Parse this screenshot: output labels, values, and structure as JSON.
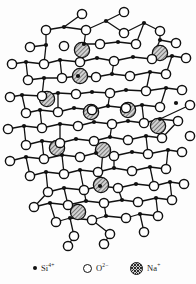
{
  "figure": {
    "background_color": "#fdfdfd",
    "width": 196,
    "height": 284
  },
  "style": {
    "bond_color": "#111111",
    "bond_width": 1.3,
    "silicon_color": "#111111",
    "silicon_radius": 2.1,
    "oxygen_fill": "#ffffff",
    "oxygen_stroke": "#111111",
    "oxygen_radius": 4.6,
    "sodium_fill": "#cfcfcf",
    "sodium_stroke": "#111111",
    "sodium_radius": 7.6
  },
  "legend": {
    "entries": [
      {
        "id": "silicon",
        "symbol": "silicon-dot-swatch",
        "element": "Si",
        "charge": "4+",
        "label": "Si4+"
      },
      {
        "id": "oxygen",
        "symbol": "oxygen-circle-swatch",
        "element": "O",
        "charge": "2-",
        "label": "O2-"
      },
      {
        "id": "sodium",
        "symbol": "sodium-hatched-swatch",
        "element": "Na",
        "charge": "+",
        "label": "Na+"
      }
    ]
  },
  "chart_data": {
    "type": "scatter",
    "xlabel": "",
    "ylabel": "",
    "xlim": [
      0,
      196
    ],
    "ylim": [
      0,
      250
    ],
    "grid": false,
    "legend_position": "bottom",
    "series": [
      {
        "name": "Si4+",
        "marker": "filled-circle",
        "points": [
          [
            64,
            27
          ],
          [
            106,
            21
          ],
          [
            144,
            23
          ],
          [
            46,
            45
          ],
          [
            84,
            44
          ],
          [
            118,
            42
          ],
          [
            160,
            40
          ],
          [
            26,
            62
          ],
          [
            60,
            60
          ],
          [
            97,
            58
          ],
          [
            133,
            57
          ],
          [
            172,
            56
          ],
          [
            44,
            78
          ],
          [
            78,
            76
          ],
          [
            112,
            74
          ],
          [
            150,
            72
          ],
          [
            22,
            95
          ],
          [
            58,
            93
          ],
          [
            92,
            92
          ],
          [
            126,
            90
          ],
          [
            166,
            88
          ],
          [
            40,
            110
          ],
          [
            74,
            108
          ],
          [
            108,
            106
          ],
          [
            142,
            105
          ],
          [
            176,
            103
          ],
          [
            24,
            126
          ],
          [
            60,
            124
          ],
          [
            94,
            122
          ],
          [
            128,
            121
          ],
          [
            160,
            119
          ],
          [
            42,
            141
          ],
          [
            76,
            139
          ],
          [
            110,
            137
          ],
          [
            146,
            136
          ],
          [
            26,
            157
          ],
          [
            62,
            155
          ],
          [
            96,
            153
          ],
          [
            132,
            152
          ],
          [
            168,
            150
          ],
          [
            46,
            172
          ],
          [
            80,
            170
          ],
          [
            114,
            168
          ],
          [
            150,
            167
          ],
          [
            64,
            188
          ],
          [
            100,
            186
          ],
          [
            136,
            184
          ],
          [
            170,
            182
          ],
          [
            50,
            203
          ],
          [
            86,
            201
          ],
          [
            122,
            200
          ],
          [
            156,
            198
          ],
          [
            70,
            218
          ],
          [
            106,
            216
          ],
          [
            140,
            214
          ]
        ]
      },
      {
        "name": "O2-",
        "marker": "open-circle",
        "points": [
          [
            82,
            14
          ],
          [
            124,
            12
          ],
          [
            46,
            30
          ],
          [
            86,
            30
          ],
          [
            124,
            33
          ],
          [
            160,
            31
          ],
          [
            30,
            47
          ],
          [
            64,
            46
          ],
          [
            100,
            44
          ],
          [
            136,
            44
          ],
          [
            176,
            43
          ],
          [
            12,
            64
          ],
          [
            44,
            64
          ],
          [
            80,
            62
          ],
          [
            114,
            61
          ],
          [
            152,
            59
          ],
          [
            186,
            58
          ],
          [
            28,
            80
          ],
          [
            62,
            78
          ],
          [
            96,
            77
          ],
          [
            130,
            76
          ],
          [
            166,
            74
          ],
          [
            10,
            97
          ],
          [
            42,
            96
          ],
          [
            76,
            94
          ],
          [
            110,
            93
          ],
          [
            146,
            91
          ],
          [
            182,
            90
          ],
          [
            26,
            113
          ],
          [
            58,
            112
          ],
          [
            92,
            110
          ],
          [
            126,
            108
          ],
          [
            160,
            107
          ],
          [
            190,
            105
          ],
          [
            8,
            129
          ],
          [
            42,
            128
          ],
          [
            78,
            126
          ],
          [
            112,
            124
          ],
          [
            144,
            123
          ],
          [
            178,
            121
          ],
          [
            26,
            145
          ],
          [
            60,
            143
          ],
          [
            94,
            141
          ],
          [
            128,
            140
          ],
          [
            162,
            138
          ],
          [
            190,
            136
          ],
          [
            10,
            161
          ],
          [
            44,
            159
          ],
          [
            80,
            157
          ],
          [
            114,
            156
          ],
          [
            148,
            154
          ],
          [
            182,
            152
          ],
          [
            30,
            176
          ],
          [
            64,
            174
          ],
          [
            98,
            172
          ],
          [
            132,
            171
          ],
          [
            166,
            169
          ],
          [
            48,
            192
          ],
          [
            84,
            190
          ],
          [
            118,
            188
          ],
          [
            154,
            186
          ],
          [
            184,
            184
          ],
          [
            34,
            207
          ],
          [
            68,
            205
          ],
          [
            104,
            203
          ],
          [
            138,
            202
          ],
          [
            172,
            200
          ],
          [
            56,
            222
          ],
          [
            92,
            220
          ],
          [
            126,
            218
          ],
          [
            158,
            216
          ],
          [
            74,
            236
          ],
          [
            110,
            234
          ],
          [
            144,
            232
          ],
          [
            68,
            246
          ],
          [
            104,
            244
          ]
        ]
      },
      {
        "name": "Na+",
        "marker": "hatched-circle",
        "points": [
          [
            82,
            50
          ],
          [
            160,
            53
          ],
          [
            80,
            76
          ],
          [
            47,
            99
          ],
          [
            91,
            112
          ],
          [
            128,
            110
          ],
          [
            158,
            126
          ],
          [
            57,
            148
          ],
          [
            103,
            150
          ],
          [
            101,
            185
          ],
          [
            78,
            212
          ]
        ]
      }
    ],
    "bonds": [
      [
        82,
        14,
        64,
        27
      ],
      [
        64,
        27,
        46,
        30
      ],
      [
        46,
        30,
        46,
        45
      ],
      [
        46,
        45,
        30,
        47
      ],
      [
        64,
        27,
        86,
        30
      ],
      [
        86,
        30,
        106,
        21
      ],
      [
        106,
        21,
        124,
        12
      ],
      [
        106,
        21,
        124,
        33
      ],
      [
        124,
        33,
        144,
        23
      ],
      [
        144,
        23,
        160,
        31
      ],
      [
        160,
        31,
        160,
        40
      ],
      [
        160,
        40,
        176,
        43
      ],
      [
        144,
        23,
        136,
        44
      ],
      [
        136,
        44,
        118,
        42
      ],
      [
        118,
        42,
        100,
        44
      ],
      [
        100,
        44,
        84,
        44
      ],
      [
        84,
        44,
        86,
        30
      ],
      [
        46,
        45,
        44,
        64
      ],
      [
        44,
        64,
        26,
        62
      ],
      [
        26,
        62,
        12,
        64
      ],
      [
        26,
        62,
        28,
        80
      ],
      [
        28,
        80,
        44,
        78
      ],
      [
        44,
        78,
        62,
        78
      ],
      [
        62,
        78,
        60,
        60
      ],
      [
        60,
        60,
        44,
        64
      ],
      [
        60,
        60,
        80,
        62
      ],
      [
        80,
        62,
        97,
        58
      ],
      [
        97,
        58,
        114,
        61
      ],
      [
        114,
        61,
        133,
        57
      ],
      [
        133,
        57,
        152,
        59
      ],
      [
        152,
        59,
        160,
        40
      ],
      [
        152,
        59,
        172,
        56
      ],
      [
        172,
        56,
        186,
        58
      ],
      [
        172,
        56,
        166,
        74
      ],
      [
        166,
        74,
        150,
        72
      ],
      [
        150,
        72,
        130,
        76
      ],
      [
        130,
        76,
        112,
        74
      ],
      [
        112,
        74,
        114,
        61
      ],
      [
        112,
        74,
        96,
        77
      ],
      [
        96,
        77,
        78,
        76
      ],
      [
        78,
        76,
        62,
        78
      ],
      [
        44,
        78,
        42,
        96
      ],
      [
        42,
        96,
        22,
        95
      ],
      [
        22,
        95,
        10,
        97
      ],
      [
        22,
        95,
        26,
        113
      ],
      [
        26,
        113,
        40,
        110
      ],
      [
        40,
        110,
        58,
        112
      ],
      [
        58,
        112,
        58,
        93
      ],
      [
        58,
        93,
        42,
        96
      ],
      [
        58,
        93,
        76,
        94
      ],
      [
        76,
        94,
        92,
        92
      ],
      [
        92,
        92,
        110,
        93
      ],
      [
        110,
        93,
        126,
        90
      ],
      [
        126,
        90,
        146,
        91
      ],
      [
        146,
        91,
        150,
        72
      ],
      [
        146,
        91,
        166,
        88
      ],
      [
        166,
        88,
        182,
        90
      ],
      [
        166,
        88,
        160,
        107
      ],
      [
        160,
        107,
        142,
        105
      ],
      [
        142,
        105,
        126,
        108
      ],
      [
        126,
        108,
        108,
        106
      ],
      [
        108,
        106,
        110,
        93
      ],
      [
        108,
        106,
        92,
        110
      ],
      [
        92,
        110,
        74,
        108
      ],
      [
        74,
        108,
        58,
        112
      ],
      [
        40,
        110,
        42,
        128
      ],
      [
        42,
        128,
        24,
        126
      ],
      [
        24,
        126,
        8,
        129
      ],
      [
        24,
        126,
        26,
        145
      ],
      [
        26,
        145,
        42,
        141
      ],
      [
        42,
        141,
        60,
        143
      ],
      [
        60,
        143,
        60,
        124
      ],
      [
        60,
        124,
        42,
        128
      ],
      [
        60,
        124,
        78,
        126
      ],
      [
        78,
        126,
        94,
        122
      ],
      [
        94,
        122,
        112,
        124
      ],
      [
        112,
        124,
        128,
        121
      ],
      [
        128,
        121,
        144,
        123
      ],
      [
        144,
        123,
        142,
        105
      ],
      [
        144,
        123,
        160,
        119
      ],
      [
        160,
        119,
        178,
        121
      ],
      [
        160,
        119,
        190,
        105
      ],
      [
        178,
        121,
        162,
        138
      ],
      [
        162,
        138,
        146,
        136
      ],
      [
        146,
        136,
        128,
        140
      ],
      [
        128,
        140,
        110,
        137
      ],
      [
        110,
        137,
        112,
        124
      ],
      [
        110,
        137,
        94,
        141
      ],
      [
        94,
        141,
        76,
        139
      ],
      [
        76,
        139,
        60,
        143
      ],
      [
        42,
        141,
        44,
        159
      ],
      [
        44,
        159,
        26,
        157
      ],
      [
        26,
        157,
        10,
        161
      ],
      [
        26,
        157,
        30,
        176
      ],
      [
        30,
        176,
        46,
        172
      ],
      [
        46,
        172,
        64,
        174
      ],
      [
        64,
        174,
        62,
        155
      ],
      [
        62,
        155,
        44,
        159
      ],
      [
        62,
        155,
        80,
        157
      ],
      [
        80,
        157,
        96,
        153
      ],
      [
        96,
        153,
        114,
        156
      ],
      [
        114,
        156,
        132,
        152
      ],
      [
        132,
        152,
        148,
        154
      ],
      [
        148,
        154,
        146,
        136
      ],
      [
        148,
        154,
        168,
        150
      ],
      [
        168,
        150,
        182,
        152
      ],
      [
        168,
        150,
        166,
        169
      ],
      [
        166,
        169,
        150,
        167
      ],
      [
        150,
        167,
        132,
        171
      ],
      [
        132,
        171,
        114,
        168
      ],
      [
        114,
        168,
        114,
        156
      ],
      [
        114,
        168,
        98,
        172
      ],
      [
        98,
        172,
        80,
        170
      ],
      [
        80,
        170,
        64,
        174
      ],
      [
        46,
        172,
        48,
        192
      ],
      [
        48,
        192,
        34,
        207
      ],
      [
        34,
        207,
        50,
        203
      ],
      [
        50,
        203,
        68,
        205
      ],
      [
        68,
        205,
        64,
        188
      ],
      [
        64,
        188,
        48,
        192
      ],
      [
        64,
        188,
        84,
        190
      ],
      [
        84,
        190,
        100,
        186
      ],
      [
        100,
        186,
        118,
        188
      ],
      [
        118,
        188,
        136,
        184
      ],
      [
        136,
        184,
        154,
        186
      ],
      [
        154,
        186,
        150,
        167
      ],
      [
        154,
        186,
        170,
        182
      ],
      [
        170,
        182,
        184,
        184
      ],
      [
        170,
        182,
        172,
        200
      ],
      [
        172,
        200,
        156,
        198
      ],
      [
        156,
        198,
        138,
        202
      ],
      [
        138,
        202,
        122,
        200
      ],
      [
        122,
        200,
        118,
        188
      ],
      [
        122,
        200,
        104,
        203
      ],
      [
        104,
        203,
        86,
        201
      ],
      [
        86,
        201,
        68,
        205
      ],
      [
        50,
        203,
        56,
        222
      ],
      [
        56,
        222,
        70,
        218
      ],
      [
        70,
        218,
        92,
        220
      ],
      [
        92,
        220,
        106,
        216
      ],
      [
        106,
        216,
        126,
        218
      ],
      [
        126,
        218,
        140,
        214
      ],
      [
        140,
        214,
        158,
        216
      ],
      [
        158,
        216,
        156,
        198
      ],
      [
        106,
        216,
        104,
        203
      ],
      [
        70,
        218,
        74,
        236
      ],
      [
        92,
        220,
        110,
        234
      ],
      [
        140,
        214,
        144,
        232
      ],
      [
        74,
        236,
        68,
        246
      ],
      [
        110,
        234,
        104,
        244
      ],
      [
        86,
        201,
        80,
        170
      ],
      [
        100,
        186,
        103,
        150
      ]
    ]
  }
}
